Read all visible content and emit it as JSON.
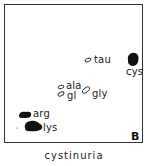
{
  "figure": {
    "panel_label": "B",
    "caption": "cystinuria",
    "spots": [
      {
        "name": "tau",
        "label": "tau",
        "style": "open"
      },
      {
        "name": "cys",
        "label": "cys",
        "style": "filled"
      },
      {
        "name": "ala",
        "label": "ala",
        "style": "open"
      },
      {
        "name": "gl",
        "label": "gl",
        "style": "open"
      },
      {
        "name": "gly",
        "label": "gly",
        "style": "open"
      },
      {
        "name": "arg",
        "label": "arg",
        "style": "filled"
      },
      {
        "name": "lys",
        "label": "lys",
        "style": "filled"
      }
    ]
  },
  "colors": {
    "ink": "#111111",
    "background": "#ffffff",
    "frame": "#333333"
  }
}
